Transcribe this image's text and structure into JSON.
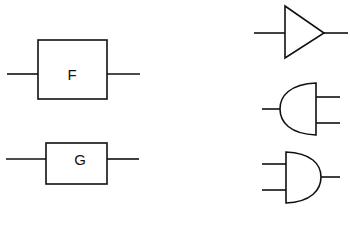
{
  "diagram": {
    "blocks": [
      {
        "id": "block-f",
        "label": "F"
      },
      {
        "id": "block-g",
        "label": "G"
      }
    ],
    "symbols": [
      {
        "id": "buffer",
        "type": "triangle-buffer"
      },
      {
        "id": "reverse-and",
        "type": "and-gate-reversed"
      },
      {
        "id": "and-gate",
        "type": "and-gate"
      }
    ],
    "colors": {
      "stroke": "#111111",
      "background": "#ffffff"
    }
  }
}
